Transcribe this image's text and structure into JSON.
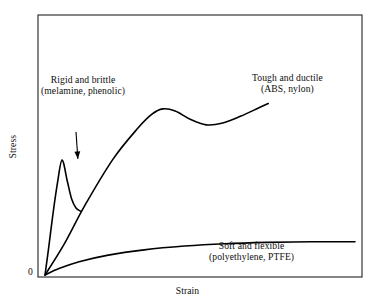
{
  "chart_data": {
    "type": "line",
    "title": "",
    "xlabel": "Strain",
    "ylabel": "Stress",
    "origin_label": "0",
    "grid": false,
    "legend": "inline-annotations",
    "axis_ranges": {
      "x": [
        0,
        1
      ],
      "y": [
        0,
        1
      ]
    },
    "axis_ticks": {
      "x": [],
      "y": []
    },
    "series": [
      {
        "name": "Rigid and brittle",
        "materials": "(melamine, phenolic)",
        "label_line1": "Rigid and brittle",
        "label_line2": "(melamine, phenolic)",
        "description": "steep nearly-linear rise terminating abruptly at fracture",
        "color": "#000000",
        "points": [
          [
            0.0,
            0.0
          ],
          [
            0.012,
            0.13
          ],
          [
            0.026,
            0.29
          ],
          [
            0.04,
            0.43
          ],
          [
            0.055,
            0.54
          ],
          [
            0.072,
            0.44
          ],
          [
            0.086,
            0.357
          ],
          [
            0.1,
            0.315
          ],
          [
            0.114,
            0.3
          ]
        ],
        "terminates_at": [
          0.114,
          0.3
        ],
        "fractures": true
      },
      {
        "name": "Tough and ductile",
        "materials": "(ABS, nylon)",
        "label_line1": "Tough and ductile",
        "label_line2": "(ABS, nylon)",
        "description": "linear elastic rise to yield peak, strain-softening dip, then strain hardening",
        "color": "#000000",
        "points": [
          [
            0.0,
            0.0
          ],
          [
            0.06,
            0.14
          ],
          [
            0.13,
            0.33
          ],
          [
            0.22,
            0.545
          ],
          [
            0.3,
            0.69
          ],
          [
            0.345,
            0.755
          ],
          [
            0.38,
            0.78
          ],
          [
            0.42,
            0.77
          ],
          [
            0.47,
            0.73
          ],
          [
            0.52,
            0.705
          ],
          [
            0.57,
            0.712
          ],
          [
            0.63,
            0.745
          ],
          [
            0.69,
            0.785
          ],
          [
            0.72,
            0.805
          ]
        ],
        "yield_peak": [
          0.38,
          0.78
        ],
        "trough": [
          0.53,
          0.703
        ],
        "terminates_at": [
          0.72,
          0.805
        ]
      },
      {
        "name": "Soft and flexible",
        "materials": "(polyethylene, PTFE)",
        "label_line1": "Soft and flexible",
        "label_line2": "(polyethylene, PTFE)",
        "description": "low-modulus concave curve flattening to a plateau",
        "color": "#000000",
        "points": [
          [
            0.0,
            0.0
          ],
          [
            0.045,
            0.03
          ],
          [
            0.11,
            0.062
          ],
          [
            0.2,
            0.092
          ],
          [
            0.32,
            0.118
          ],
          [
            0.45,
            0.136
          ],
          [
            0.58,
            0.147
          ],
          [
            0.72,
            0.153
          ],
          [
            0.86,
            0.156
          ],
          [
            1.0,
            0.156
          ]
        ],
        "plateau_level": 0.156
      }
    ],
    "annotations": [
      {
        "name": "arrow-to-rigid-curve",
        "type": "arrow",
        "target_series": "Rigid and brittle",
        "direction": "down",
        "from": [
          0.1,
          0.672
        ],
        "to": [
          0.106,
          0.545
        ]
      }
    ]
  },
  "labels": {
    "rigid": {
      "line1": "Rigid and brittle",
      "line2": "(melamine, phenolic)"
    },
    "tough": {
      "line1": "Tough and ductile",
      "line2": "(ABS, nylon)"
    },
    "soft": {
      "line1": "Soft and flexible",
      "line2": "(polyethylene, PTFE)"
    }
  },
  "axes": {
    "x_title": "Strain",
    "y_title": "Stress",
    "origin": "0"
  },
  "colors": {
    "curve": "#000000",
    "frame": "#222222",
    "background": "#ffffff",
    "text": "#0d0d0d"
  }
}
